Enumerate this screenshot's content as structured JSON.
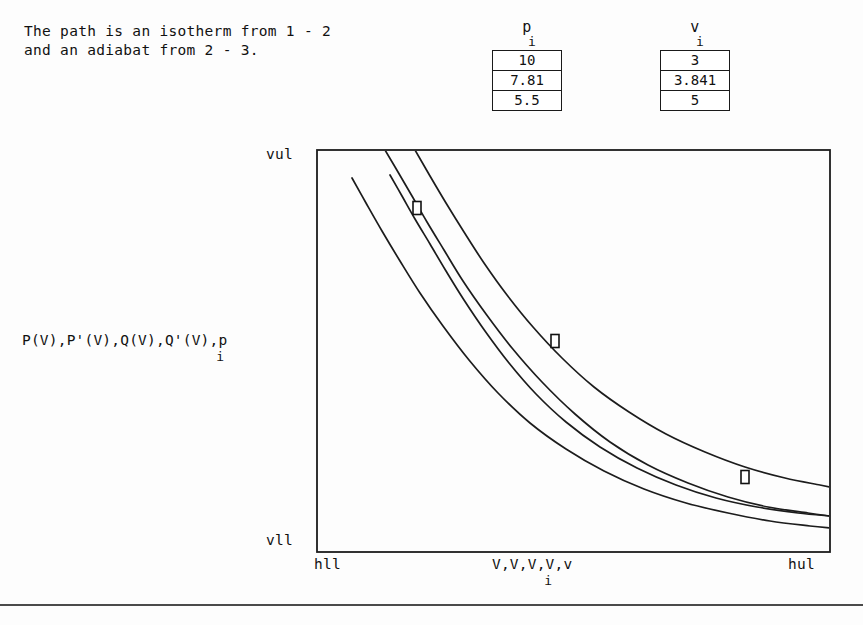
{
  "caption": {
    "line1": "The path is an isotherm from 1 - 2",
    "line2": "and an adiabat from 2 - 3."
  },
  "tables": [
    {
      "name": "pressure-table",
      "header": "p",
      "header_subscript": "i",
      "values": [
        "10",
        "7.81",
        "5.5"
      ]
    },
    {
      "name": "volume-table",
      "header": "v",
      "header_subscript": "i",
      "values": [
        "3",
        "3.841",
        "5"
      ]
    }
  ],
  "chart_data": {
    "type": "line",
    "title": "",
    "xlabel": "V,V,V,V,v",
    "xlabel_subscript": "i",
    "ylabel": "P(V),P'(V),Q(V),Q'(V),p",
    "ylabel_subscript": "i",
    "axis_ticks": {
      "y_top": "vul",
      "y_bottom": "vll",
      "x_left": "hll",
      "x_right": "hul"
    },
    "grid": false,
    "legend": "none",
    "frame": {
      "x0": 317,
      "y0": 150,
      "x1": 830,
      "y1": 552
    },
    "series": [
      {
        "name": "P(V)",
        "points": [
          [
            385,
            150
          ],
          [
            398,
            172
          ],
          [
            412,
            196
          ],
          [
            427,
            222
          ],
          [
            444,
            250
          ],
          [
            463,
            281
          ],
          [
            486,
            314
          ],
          [
            512,
            348
          ],
          [
            542,
            382
          ],
          [
            575,
            414
          ],
          [
            610,
            442
          ],
          [
            648,
            465
          ],
          [
            688,
            483
          ],
          [
            728,
            497
          ],
          [
            768,
            507
          ],
          [
            808,
            513
          ],
          [
            830,
            516
          ]
        ]
      },
      {
        "name": "P'(V)",
        "points": [
          [
            352,
            178
          ],
          [
            366,
            203
          ],
          [
            382,
            231
          ],
          [
            400,
            261
          ],
          [
            420,
            293
          ],
          [
            443,
            326
          ],
          [
            469,
            360
          ],
          [
            498,
            393
          ],
          [
            530,
            423
          ],
          [
            566,
            449
          ],
          [
            604,
            471
          ],
          [
            644,
            489
          ],
          [
            686,
            503
          ],
          [
            728,
            513
          ],
          [
            770,
            521
          ],
          [
            810,
            526
          ],
          [
            830,
            528
          ]
        ]
      },
      {
        "name": "Q(V)",
        "points": [
          [
            390,
            175
          ],
          [
            402,
            196
          ],
          [
            415,
            219
          ],
          [
            430,
            244
          ],
          [
            446,
            271
          ],
          [
            464,
            300
          ],
          [
            485,
            331
          ],
          [
            509,
            363
          ],
          [
            536,
            394
          ],
          [
            566,
            422
          ],
          [
            600,
            447
          ],
          [
            637,
            468
          ],
          [
            676,
            485
          ],
          [
            716,
            498
          ],
          [
            757,
            507
          ],
          [
            798,
            513
          ],
          [
            830,
            516
          ]
        ]
      },
      {
        "name": "Q'(V)",
        "points": [
          [
            415,
            150
          ],
          [
            430,
            176
          ],
          [
            446,
            203
          ],
          [
            464,
            232
          ],
          [
            484,
            263
          ],
          [
            507,
            295
          ],
          [
            533,
            327
          ],
          [
            562,
            358
          ],
          [
            594,
            387
          ],
          [
            629,
            412
          ],
          [
            666,
            434
          ],
          [
            705,
            452
          ],
          [
            745,
            467
          ],
          [
            785,
            478
          ],
          [
            820,
            485
          ],
          [
            830,
            487
          ]
        ]
      }
    ],
    "markers": [
      {
        "label": "1",
        "x": 417,
        "y": 208
      },
      {
        "label": "2",
        "x": 555,
        "y": 341
      },
      {
        "label": "3",
        "x": 745,
        "y": 477
      }
    ]
  }
}
